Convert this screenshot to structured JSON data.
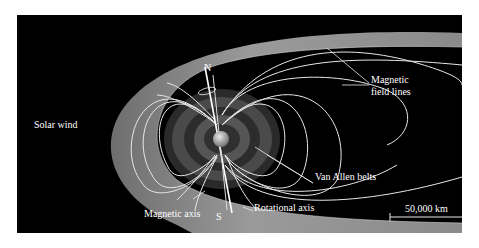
{
  "diagram": {
    "labels": {
      "north_pole": "N",
      "south_pole": "S",
      "solar_wind": "Solar wind",
      "magnetic_field_lines_1": "Magnetic",
      "magnetic_field_lines_2": "field lines",
      "van_allen_belts": "Van Allen belts",
      "magnetic_axis": "Magnetic axis",
      "rotational_axis": "Rotational axis",
      "scale_bar": "50,000 km"
    },
    "colors": {
      "background": "#000000",
      "magnetopause": "#8c8c8c",
      "field_lines": "#e8e8e8",
      "belt_outer": "#3a3a3a",
      "belt_inner": "#555555",
      "earth": "#bdbdbd",
      "text": "#ffffff"
    }
  }
}
